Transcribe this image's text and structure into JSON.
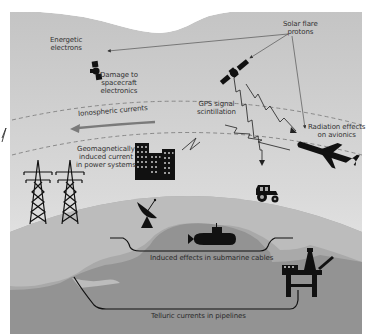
{
  "diagram": {
    "colors": {
      "sky_top": "#ffffff",
      "sky_upper": "#c9c9c9",
      "sky_lower": "#e8e8e8",
      "ground": "#a6a6a6",
      "land": "#b9b9b9",
      "sea": "#8f8f8f",
      "icon": "#111111",
      "arrow": "#7a7a7a",
      "dashed": "#7f7f7f"
    },
    "labels": {
      "energetic_electrons": [
        "Energetic",
        "electrons"
      ],
      "solar_flare_protons": [
        "Solar flare",
        "protons"
      ],
      "spacecraft_damage": [
        "Damage to",
        "spacecraft",
        "electronics"
      ],
      "ionospheric_currents": "Ionospheric currents",
      "gps_scintillation": [
        "GPS signal",
        "scintillation"
      ],
      "radiation_avionics": [
        "Radiation effects",
        "on avionics"
      ],
      "gic_power": [
        "Geomagnetically",
        "induced current",
        "in power systems"
      ],
      "submarine_cables": "Induced effects in submarine cables",
      "telluric_pipelines": "Telluric currents in pipelines"
    },
    "icons": [
      "satellite-icon-spacecraft",
      "satellite-icon-gps",
      "airplane-icon",
      "buildings-icon",
      "power-pylon-icon",
      "tractor-icon",
      "satellite-dish-icon",
      "submarine-icon",
      "oil-rig-icon"
    ]
  }
}
